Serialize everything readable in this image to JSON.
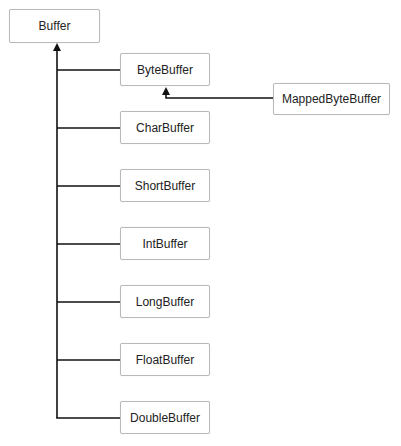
{
  "diagram": {
    "type": "class-hierarchy",
    "root": {
      "label": "Buffer"
    },
    "children": [
      {
        "label": "ByteBuffer"
      },
      {
        "label": "CharBuffer"
      },
      {
        "label": "ShortBuffer"
      },
      {
        "label": "IntBuffer"
      },
      {
        "label": "LongBuffer"
      },
      {
        "label": "FloatBuffer"
      },
      {
        "label": "DoubleBuffer"
      }
    ],
    "grandchild": {
      "label": "MappedByteBuffer",
      "parent": "ByteBuffer"
    },
    "colors": {
      "line": "#111111",
      "box_border": "#b9b9b9",
      "background": "#ffffff"
    }
  }
}
